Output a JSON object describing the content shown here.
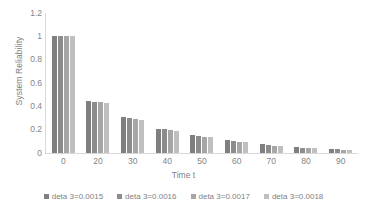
{
  "chart_data": {
    "type": "bar",
    "title": "",
    "xlabel": "Time t",
    "ylabel": "System Reliability",
    "categories": [
      "0",
      "20",
      "30",
      "40",
      "50",
      "60",
      "70",
      "80",
      "90"
    ],
    "ylim": [
      0,
      1.2
    ],
    "yticks": [
      "0",
      "0.2",
      "0.4",
      "0.6",
      "0.8",
      "1",
      "1.2"
    ],
    "ytick_values": [
      0,
      0.2,
      0.4,
      0.6,
      0.8,
      1,
      1.2
    ],
    "grid": false,
    "legend_position": "bottom",
    "series": [
      {
        "name": "deta 3=0.0015",
        "color": "#7f7f7f",
        "values": [
          1.0,
          0.45,
          0.305,
          0.21,
          0.155,
          0.108,
          0.073,
          0.05,
          0.034
        ]
      },
      {
        "name": "deta 3=0.0016",
        "color": "#8c8c8c",
        "values": [
          1.0,
          0.44,
          0.297,
          0.203,
          0.148,
          0.102,
          0.068,
          0.046,
          0.031
        ]
      },
      {
        "name": "deta 3=0.0017",
        "color": "#a6a6a6",
        "values": [
          1.0,
          0.435,
          0.29,
          0.196,
          0.141,
          0.096,
          0.064,
          0.042,
          0.028
        ]
      },
      {
        "name": "deta 3=0.0018",
        "color": "#bfbfbf",
        "values": [
          1.0,
          0.428,
          0.283,
          0.189,
          0.134,
          0.091,
          0.059,
          0.039,
          0.025
        ]
      }
    ]
  }
}
